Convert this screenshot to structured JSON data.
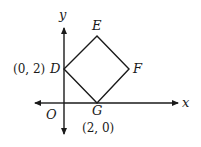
{
  "diagram": {
    "type": "coordinate-plane-square",
    "axes": {
      "x_label": "x",
      "y_label": "y",
      "origin_label": "O"
    },
    "vertices": [
      {
        "name": "D",
        "coord_label": "(0, 2)",
        "coords": [
          0,
          2
        ]
      },
      {
        "name": "E",
        "coord_label": "",
        "coords": [
          2,
          4
        ]
      },
      {
        "name": "F",
        "coord_label": "",
        "coords": [
          4,
          2
        ]
      },
      {
        "name": "G",
        "coord_label": "(2, 0)",
        "coords": [
          2,
          0
        ]
      }
    ],
    "labels": {
      "D": "D",
      "E": "E",
      "F": "F",
      "G": "G",
      "D_coord": "(0, 2)",
      "G_coord": "(2, 0)"
    },
    "colors": {
      "line": "#1a1a1a",
      "background": "#ffffff"
    }
  }
}
